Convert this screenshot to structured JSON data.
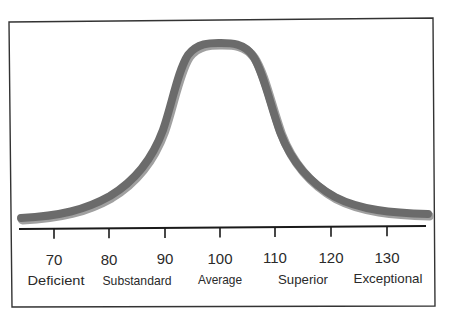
{
  "chart_data": {
    "type": "line",
    "title": "",
    "xlabel": "",
    "ylabel": "",
    "x_ticks": [
      70,
      80,
      90,
      100,
      110,
      120,
      130
    ],
    "x_tick_labels": [
      "70",
      "80",
      "90",
      "100",
      "110",
      "120",
      "130"
    ],
    "category_labels": [
      "Deficient",
      "Substandard",
      "Average",
      "Superior",
      "Exceptional"
    ],
    "xlim": [
      63,
      137
    ],
    "grid": false,
    "legend": null,
    "series": [
      {
        "name": "distribution",
        "mean": 100,
        "x": [
          63,
          70,
          80,
          85,
          90,
          95,
          100,
          105,
          110,
          115,
          120,
          130,
          137
        ],
        "y_relative": [
          0.0,
          0.02,
          0.1,
          0.23,
          0.5,
          0.9,
          1.0,
          0.9,
          0.5,
          0.23,
          0.1,
          0.02,
          0.0
        ]
      }
    ],
    "colors": {
      "curve": "#6b6b6b",
      "curve_shadow": "#9e9e9e",
      "axis": "#1a1a1a",
      "frame": "#333333"
    }
  },
  "axis": {
    "ticks": [
      {
        "value": "70",
        "x": 54
      },
      {
        "value": "80",
        "x": 109
      },
      {
        "value": "90",
        "x": 165
      },
      {
        "value": "100",
        "x": 220
      },
      {
        "value": "110",
        "x": 275
      },
      {
        "value": "120",
        "x": 331
      },
      {
        "value": "130",
        "x": 387
      }
    ],
    "categories": [
      {
        "label": "Deficient",
        "x": 56
      },
      {
        "label": "Substandard",
        "x": 137
      },
      {
        "label": "Average",
        "x": 220
      },
      {
        "label": "Superior",
        "x": 303
      },
      {
        "label": "Exceptional",
        "x": 388
      }
    ]
  }
}
